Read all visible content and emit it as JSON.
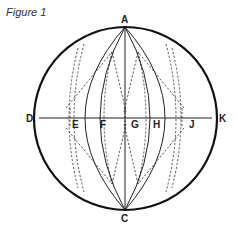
{
  "figure": {
    "title": "Figure 1",
    "labels": {
      "A": "A",
      "C": "C",
      "D": "D",
      "E": "E",
      "F": "F",
      "G": "G",
      "H": "H",
      "J": "J",
      "K": "K"
    }
  }
}
